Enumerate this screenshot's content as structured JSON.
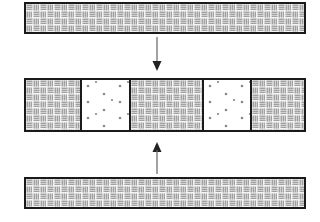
{
  "diagram": {
    "colors": {
      "background": "#ffffff",
      "border": "#1a1a1a",
      "weave_stripe": "#6e6e6e",
      "weave_fill": "#f4f4f4",
      "dot": "#8a8a8a",
      "arrow": "#555555"
    },
    "top_bar": {
      "pattern": "woven"
    },
    "arrow_down": {
      "direction": "down"
    },
    "middle_bar": {
      "segments": [
        {
          "pattern": "woven"
        },
        {
          "pattern": "dotted"
        },
        {
          "pattern": "woven"
        },
        {
          "pattern": "dotted"
        },
        {
          "pattern": "woven"
        }
      ]
    },
    "arrow_up": {
      "direction": "up"
    },
    "bottom_bar": {
      "pattern": "woven"
    }
  }
}
